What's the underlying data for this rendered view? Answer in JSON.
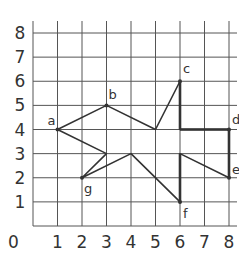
{
  "grid": {
    "x_min": 0,
    "x_max": 8,
    "y_min": 0,
    "y_max": 8,
    "origin_label": "0",
    "x_ticks": [
      "1",
      "2",
      "3",
      "4",
      "5",
      "6",
      "7",
      "8"
    ],
    "y_ticks": [
      "1",
      "2",
      "3",
      "4",
      "5",
      "6",
      "7",
      "8"
    ],
    "line_color": "#555555",
    "shape_color": "#333333"
  },
  "points": [
    {
      "label": "a",
      "x": 1,
      "y": 4
    },
    {
      "label": "b",
      "x": 3,
      "y": 5
    },
    {
      "label": "c",
      "x": 6,
      "y": 6
    },
    {
      "label": "d",
      "x": 8,
      "y": 4
    },
    {
      "label": "e",
      "x": 8,
      "y": 2
    },
    {
      "label": "f",
      "x": 6,
      "y": 1
    },
    {
      "label": "g",
      "x": 2,
      "y": 2
    }
  ],
  "path": [
    [
      1,
      4
    ],
    [
      3,
      5
    ],
    [
      5,
      4
    ],
    [
      6,
      6
    ],
    [
      6,
      4
    ],
    [
      8,
      4
    ],
    [
      8,
      2
    ],
    [
      6,
      3
    ],
    [
      6,
      1
    ],
    [
      4,
      3
    ],
    [
      2,
      2
    ],
    [
      3,
      3
    ],
    [
      1,
      4
    ]
  ],
  "bold_segments": [
    [
      [
        6,
        6
      ],
      [
        6,
        4
      ]
    ],
    [
      [
        6,
        4
      ],
      [
        8,
        4
      ]
    ],
    [
      [
        8,
        4
      ],
      [
        8,
        2
      ]
    ],
    [
      [
        6,
        3
      ],
      [
        6,
        1
      ]
    ]
  ]
}
